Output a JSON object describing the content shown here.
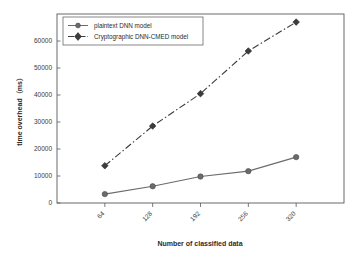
{
  "chart_data": {
    "type": "line",
    "title": "",
    "xlabel": "Number of classified data",
    "ylabel": "time overhead（ms）",
    "categories": [
      "64",
      "128",
      "192",
      "256",
      "320"
    ],
    "x": [
      64,
      128,
      192,
      256,
      320
    ],
    "series": [
      {
        "name": "plaintext DNN model",
        "values": [
          3300,
          6200,
          9800,
          11800,
          17000
        ],
        "color": "#6b6b6b",
        "marker": "circle",
        "linestyle": "solid"
      },
      {
        "name": "Cryptographic DNN-CMED model",
        "values": [
          13800,
          28500,
          40500,
          56300,
          67000
        ],
        "color": "#3c3c3c",
        "marker": "diamond",
        "linestyle": "dashdot"
      }
    ],
    "ylim": [
      0,
      70000
    ],
    "xlim": [
      0,
      6
    ],
    "yticks": [
      0,
      10000,
      20000,
      30000,
      40000,
      50000,
      60000
    ],
    "ytick_labels": [
      "0",
      "10000",
      "20000",
      "30000",
      "40000",
      "50000",
      "60000"
    ],
    "xtick_labels": [
      "64",
      "128",
      "192",
      "256",
      "320"
    ],
    "xtick_rotation": -45,
    "grid": false,
    "legend_position": "upper left",
    "legend_entries": [
      "plaintext DNN model",
      "Cryptographic DNN-CMED model"
    ],
    "axis_color": "#5a5a5a",
    "background_color": "#ffffff"
  }
}
